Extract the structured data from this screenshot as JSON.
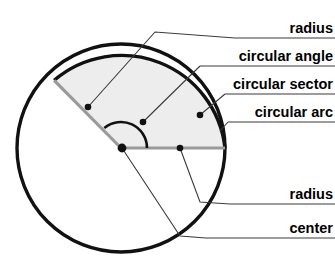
{
  "diagram": {
    "type": "geometry-annotated-figure",
    "colors": {
      "outline": "#111111",
      "sector_fill": "#ededed",
      "radius_line": "#9a9a9a",
      "leader_line": "#3a3a3a",
      "point_marker": "#111111",
      "background": "#ffffff"
    },
    "circle": {
      "center_x": 121,
      "center_y": 148,
      "radius": 104,
      "stroke_width": 3.4
    },
    "sector": {
      "start_angle_deg": 0,
      "end_angle_deg": 130,
      "fill": "#ededed"
    },
    "angle_arc": {
      "radius": 26,
      "start_angle_deg": 0,
      "end_angle_deg": 130
    },
    "labels": [
      {
        "id": "radius-upper",
        "text": "radius",
        "text_x": 333,
        "text_y": 33,
        "rule_y": 38,
        "rule_x_start": 235,
        "leader_points": "235,38 155,32 88,107",
        "dot_x": 88,
        "dot_y": 107
      },
      {
        "id": "circular-angle",
        "text": "circular angle",
        "text_x": 333,
        "text_y": 61,
        "rule_y": 66,
        "rule_x_start": 200,
        "leader_points": "200,66 143,122",
        "dot_x": 143,
        "dot_y": 122
      },
      {
        "id": "circular-sector",
        "text": "circular sector",
        "text_x": 333,
        "text_y": 89,
        "rule_y": 94,
        "rule_x_start": 225,
        "leader_points": "225,94 200,115",
        "dot_x": 200,
        "dot_y": 115
      },
      {
        "id": "circular-arc",
        "text": "circular arc",
        "text_x": 333,
        "text_y": 117,
        "rule_y": 122,
        "rule_x_start": 228,
        "leader_points": "228,122 220,131",
        "dot_x": null,
        "dot_y": null
      },
      {
        "id": "radius-lower",
        "text": "radius",
        "text_x": 333,
        "text_y": 199,
        "rule_y": 204,
        "rule_x_start": 230,
        "leader_points": "230,204 200,202 180,148",
        "dot_x": 180,
        "dot_y": 148
      },
      {
        "id": "center",
        "text": "center",
        "text_x": 333,
        "text_y": 233,
        "rule_y": 238,
        "rule_x_start": 206,
        "leader_points": "206,238 180,236 122,148",
        "dot_x": 122,
        "dot_y": 148
      }
    ]
  }
}
